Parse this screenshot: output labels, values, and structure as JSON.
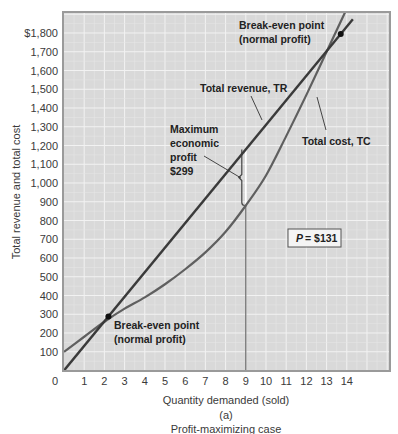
{
  "chart_data": {
    "type": "line",
    "title": "",
    "subtitle": "(a)",
    "caption": "Profit-maximizing case",
    "xlabel": "Quantity demanded (sold)",
    "ylabel": "Total revenue and total cost",
    "xlim": [
      0,
      16.2
    ],
    "ylim": [
      0,
      1920
    ],
    "x_ticks": [
      0,
      1,
      2,
      3,
      4,
      5,
      6,
      7,
      8,
      9,
      10,
      11,
      12,
      13,
      14
    ],
    "x_tick_labels": [
      "0",
      "1",
      "2",
      "3",
      "4",
      "5",
      "6",
      "7",
      "8",
      "9",
      "10",
      "11",
      "12",
      "13",
      "14"
    ],
    "y_ticks": [
      100,
      200,
      300,
      400,
      500,
      600,
      700,
      800,
      900,
      1000,
      1100,
      1200,
      1300,
      1400,
      1500,
      1600,
      1700,
      1800
    ],
    "y_tick_labels": [
      "100",
      "200",
      "300",
      "400",
      "500",
      "600",
      "700",
      "800",
      "900",
      "1,000",
      "1,100",
      "1,200",
      "1,300",
      "1,400",
      "1,500",
      "1,600",
      "1,700",
      "$1,800"
    ],
    "grid": true,
    "x": [
      0,
      1,
      2,
      3,
      4,
      5,
      6,
      7,
      8,
      9,
      10,
      11,
      12,
      13,
      14
    ],
    "series": [
      {
        "name": "Total revenue, TR",
        "values": [
          0,
          131,
          262,
          393,
          524,
          655,
          786,
          917,
          1048,
          1179,
          1310,
          1441,
          1572,
          1703,
          1834
        ],
        "color": "#3a3a3a"
      },
      {
        "name": "Total cost, TC",
        "values": [
          100,
          180,
          260,
          330,
          390,
          460,
          540,
          630,
          740,
          880,
          1040,
          1250,
          1470,
          1700,
          1930
        ],
        "color": "#5a5a5a"
      }
    ],
    "annotations": [
      {
        "id": "break_even_low",
        "text": [
          "Break-even point",
          "(normal profit)"
        ],
        "x": 2.2,
        "y": 288
      },
      {
        "id": "break_even_high",
        "text": [
          "Break-even point",
          "(normal profit)"
        ],
        "x": 13.7,
        "y": 1795
      },
      {
        "id": "tr_label",
        "text": [
          "Total revenue, TR"
        ]
      },
      {
        "id": "tc_label",
        "text": [
          "Total cost, TC"
        ]
      },
      {
        "id": "max_profit",
        "text": [
          "Maximum",
          "economic",
          "profit",
          "$299"
        ],
        "x": 9,
        "y_top": 1179,
        "y_bottom": 880
      },
      {
        "id": "price_box",
        "text": [
          "P",
          "= $131"
        ]
      }
    ],
    "price": 131,
    "max_profit_quantity": 9,
    "max_profit": 299
  },
  "colors": {
    "plot_bg": "#d9d9d9",
    "grid": "#f2f2f2",
    "frame": "#9a9a9a",
    "tr_line": "#3a3a3a",
    "tc_line": "#5f5f5f"
  }
}
